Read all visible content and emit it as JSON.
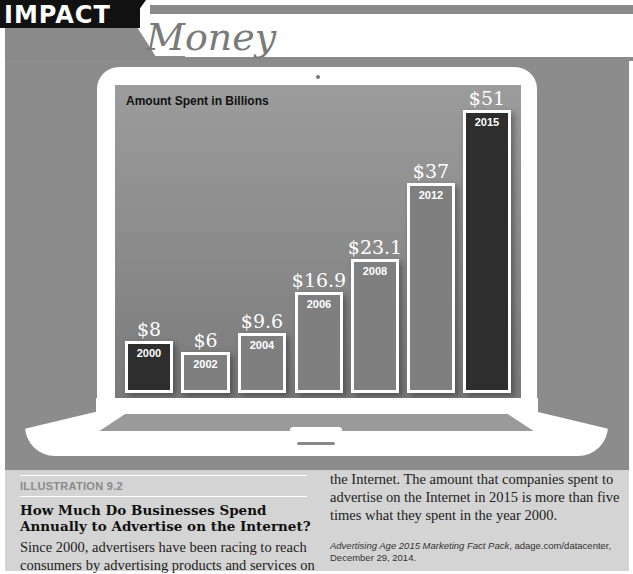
{
  "header": {
    "section_label": "IMPACT",
    "title": "Money"
  },
  "chart_data": {
    "type": "bar",
    "title": "Amount Spent in Billions",
    "xlabel": "",
    "ylabel": "Amount Spent in Billions",
    "categories": [
      "2000",
      "2002",
      "2004",
      "2006",
      "2008",
      "2012",
      "2015"
    ],
    "values": [
      8,
      6,
      9.6,
      16.9,
      23.1,
      37,
      51
    ],
    "value_labels": [
      "$8",
      "$6",
      "$9.6",
      "$16.9",
      "$23.1",
      "$37",
      "$51"
    ],
    "units": "USD billions",
    "ylim": [
      0,
      55
    ],
    "grid": false,
    "legend": null,
    "highlighted": [
      "2000",
      "2015"
    ]
  },
  "bars": [
    {
      "year": "2000",
      "label": "$8",
      "left": 125,
      "top": 341,
      "width": 48,
      "height": 52,
      "color": "#2e2e2e"
    },
    {
      "year": "2002",
      "label": "$6",
      "left": 181,
      "top": 352,
      "width": 49,
      "height": 41,
      "color": "#7f7f7f"
    },
    {
      "year": "2004",
      "label": "$9.6",
      "left": 238,
      "top": 333,
      "width": 48,
      "height": 60,
      "color": "#7f7f7f"
    },
    {
      "year": "2006",
      "label": "$16.9",
      "left": 295,
      "top": 292,
      "width": 48,
      "height": 101,
      "color": "#7f7f7f"
    },
    {
      "year": "2008",
      "label": "$23.1",
      "left": 351,
      "top": 259,
      "width": 48,
      "height": 134,
      "color": "#7f7f7f"
    },
    {
      "year": "2012",
      "label": "$37",
      "left": 407,
      "top": 183,
      "width": 48,
      "height": 210,
      "color": "#7f7f7f"
    },
    {
      "year": "2015",
      "label": "$51",
      "left": 463,
      "top": 110,
      "width": 48,
      "height": 283,
      "color": "#2e2e2e"
    }
  ],
  "caption": {
    "label": "ILLUSTRATION 9.2",
    "heading": "How Much Do Businesses Spend Annually to Advertise on the Internet?",
    "body_left": "Since 2000, advertisers have been racing to reach consumers by advertising products and services on",
    "body_right": "the Internet. The amount that companies spent to advertise on the Internet in 2015 is more than five times what they spent in the year 2000.",
    "source_title": "Advertising Age 2015 Marketing Fact Pack",
    "source_rest": ", adage.com/datacenter, December 29, 2014."
  },
  "colors": {
    "panel_gray": "#8c8c8c",
    "caption_bg": "#d4d4d4",
    "highlight_bar": "#2e2e2e",
    "normal_bar": "#7f7f7f"
  }
}
